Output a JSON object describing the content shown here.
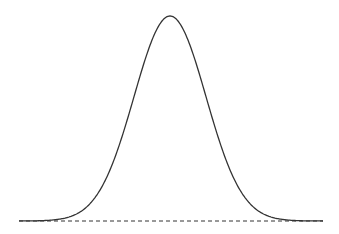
{
  "chart_data": {
    "type": "line",
    "title": "",
    "xlabel": "",
    "ylabel": "",
    "grid": false,
    "legend": null,
    "series": [
      {
        "name": "normal-distribution-curve",
        "distribution": "gaussian",
        "mean": 0,
        "std": 1,
        "x_range": [
          -4.2,
          4.2
        ],
        "style": "solid",
        "color": "#333333"
      },
      {
        "name": "baseline",
        "y": 0,
        "style": "dashed",
        "color": "#333333"
      }
    ],
    "layout": {
      "plot_left_px": 19,
      "plot_right_px": 323,
      "baseline_y_px": 221,
      "peak_y_px": 16,
      "center_x_px": 170,
      "sigma_px": 36
    }
  }
}
